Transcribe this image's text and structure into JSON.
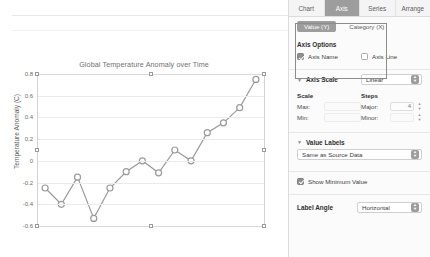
{
  "chart_data": {
    "type": "line",
    "title": "Global Temperature Anomaly over Time",
    "xlabel": "",
    "ylabel": "Temperature Anomaly (C)",
    "ylim": [
      -0.6,
      0.8
    ],
    "yticks": [
      "0.8",
      "0.6",
      "0.4",
      "0.2",
      "0",
      "-0.2",
      "-0.4",
      "-0.6"
    ],
    "ytick_values": [
      0.8,
      0.6,
      0.4,
      0.2,
      0,
      -0.2,
      -0.4,
      -0.6
    ],
    "grid": true,
    "legend": "none",
    "markers": "open-circle",
    "series": [
      {
        "name": "Temperature Anomaly",
        "color": "#9a9a9a",
        "values": [
          -0.25,
          -0.4,
          -0.15,
          -0.53,
          -0.25,
          -0.1,
          0.0,
          -0.11,
          0.1,
          0.0,
          0.26,
          0.35,
          0.49,
          0.75
        ]
      }
    ]
  },
  "inspector": {
    "tabs": [
      {
        "label": "Chart",
        "active": false
      },
      {
        "label": "Axis",
        "active": true
      },
      {
        "label": "Series",
        "active": false
      },
      {
        "label": "Arrange",
        "active": false
      }
    ],
    "axis_segments": [
      {
        "label": "Value (Y)",
        "active": true
      },
      {
        "label": "Category (X)",
        "active": false
      }
    ],
    "axis_options": {
      "heading": "Axis Options",
      "axis_name": {
        "label": "Axis Name",
        "checked": true
      },
      "axis_line": {
        "label": "Axis Line",
        "checked": false
      }
    },
    "axis_scale": {
      "heading": "Axis Scale",
      "type_value": "Linear",
      "scale_heading": "Scale",
      "steps_heading": "Steps",
      "max_label": "Max:",
      "max_value": "",
      "min_label": "Min:",
      "min_value": "",
      "major_label": "Major:",
      "major_value": "4",
      "minor_label": "Minor:",
      "minor_value": ""
    },
    "value_labels": {
      "heading": "Value Labels",
      "source_value": "Same as Source Data"
    },
    "show_minimum_value": {
      "label": "Show Minimum Value",
      "checked": true
    },
    "label_angle": {
      "heading": "Label Angle",
      "value": "Horizontal"
    }
  },
  "colors": {
    "accent": "#9d9d9d",
    "series": "#9a9a9a",
    "grid": "#ebebeb",
    "panel_bg": "#fbfbfb"
  }
}
